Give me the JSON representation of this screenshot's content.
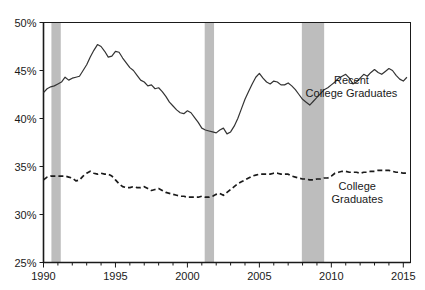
{
  "chart_data": {
    "type": "line",
    "title": "",
    "subtitle": "",
    "xlabel": "",
    "ylabel": "",
    "xlim": [
      1990,
      2015.5
    ],
    "ylim": [
      25,
      50
    ],
    "y_tick_labels": [
      "25%",
      "30%",
      "35%",
      "40%",
      "45%",
      "50%"
    ],
    "y_ticks": [
      25,
      30,
      35,
      40,
      45,
      50
    ],
    "x_tick_labels": [
      "1990",
      "1995",
      "2000",
      "2005",
      "2010",
      "2015"
    ],
    "x_ticks": [
      1990,
      1995,
      2000,
      2005,
      2010,
      2015
    ],
    "grid": false,
    "legend_position": "inline-annotation",
    "background_color": "#ffffff",
    "axis_color": "#1a1a1a",
    "recession_band_color": "#bdbdbd",
    "recession_bands": [
      {
        "start": 1990.55,
        "end": 1991.2
      },
      {
        "start": 2001.2,
        "end": 2001.85
      },
      {
        "start": 2007.95,
        "end": 2009.5
      }
    ],
    "series": [
      {
        "name": "Recent College Graduates",
        "style": "solid",
        "color": "#333333",
        "label_x": 2011.4,
        "label_y": 43.6,
        "x": [
          1990.0,
          1990.25,
          1990.5,
          1990.75,
          1991.0,
          1991.25,
          1991.5,
          1991.75,
          1992.0,
          1992.25,
          1992.5,
          1992.75,
          1993.0,
          1993.25,
          1993.5,
          1993.75,
          1994.0,
          1994.25,
          1994.5,
          1994.75,
          1995.0,
          1995.25,
          1995.5,
          1995.75,
          1996.0,
          1996.25,
          1996.5,
          1996.75,
          1997.0,
          1997.25,
          1997.5,
          1997.75,
          1998.0,
          1998.25,
          1998.5,
          1998.75,
          1999.0,
          1999.25,
          1999.5,
          1999.75,
          2000.0,
          2000.25,
          2000.5,
          2000.75,
          2001.0,
          2001.25,
          2001.5,
          2001.75,
          2002.0,
          2002.25,
          2002.5,
          2002.75,
          2003.0,
          2003.25,
          2003.5,
          2003.75,
          2004.0,
          2004.25,
          2004.5,
          2004.75,
          2005.0,
          2005.25,
          2005.5,
          2005.75,
          2006.0,
          2006.25,
          2006.5,
          2006.75,
          2007.0,
          2007.25,
          2007.5,
          2007.75,
          2008.0,
          2008.25,
          2008.5,
          2008.75,
          2009.0,
          2009.25,
          2009.5,
          2009.75,
          2010.0,
          2010.25,
          2010.5,
          2010.75,
          2011.0,
          2011.25,
          2011.5,
          2011.75,
          2012.0,
          2012.25,
          2012.5,
          2012.75,
          2013.0,
          2013.25,
          2013.5,
          2013.75,
          2014.0,
          2014.25,
          2014.5,
          2014.75,
          2015.0,
          2015.25
        ],
        "values": [
          42.7,
          43.1,
          43.3,
          43.4,
          43.6,
          43.8,
          44.3,
          44.0,
          44.2,
          44.3,
          44.4,
          45.0,
          45.6,
          46.4,
          47.1,
          47.7,
          47.5,
          47.0,
          46.4,
          46.5,
          47.0,
          46.9,
          46.3,
          45.8,
          45.3,
          45.0,
          44.5,
          44.0,
          43.8,
          43.4,
          43.5,
          43.1,
          43.2,
          42.8,
          42.3,
          41.7,
          41.3,
          40.9,
          40.6,
          40.5,
          40.8,
          40.6,
          40.1,
          39.6,
          39.0,
          38.8,
          38.7,
          38.6,
          38.5,
          38.8,
          39.0,
          38.4,
          38.6,
          39.2,
          40.0,
          41.0,
          42.0,
          42.8,
          43.6,
          44.3,
          44.7,
          44.2,
          43.8,
          43.6,
          43.9,
          43.8,
          43.5,
          43.5,
          43.7,
          43.4,
          43.0,
          42.5,
          42.0,
          41.7,
          41.4,
          41.8,
          42.2,
          42.6,
          43.0,
          43.2,
          43.5,
          43.8,
          44.2,
          44.4,
          44.6,
          44.2,
          43.6,
          43.8,
          44.2,
          44.6,
          44.4,
          44.8,
          45.1,
          44.8,
          44.6,
          44.9,
          45.2,
          45.0,
          44.5,
          44.1,
          43.9,
          44.3
        ]
      },
      {
        "name": "College Graduates",
        "style": "dashed",
        "color": "#1a1a1a",
        "label_x": 2011.8,
        "label_y": 32.6,
        "x": [
          1990.0,
          1990.25,
          1990.5,
          1990.75,
          1991.0,
          1991.25,
          1991.5,
          1991.75,
          1992.0,
          1992.25,
          1992.5,
          1992.75,
          1993.0,
          1993.25,
          1993.5,
          1993.75,
          1994.0,
          1994.25,
          1994.5,
          1994.75,
          1995.0,
          1995.25,
          1995.5,
          1995.75,
          1996.0,
          1996.25,
          1996.5,
          1996.75,
          1997.0,
          1997.25,
          1997.5,
          1997.75,
          1998.0,
          1998.25,
          1998.5,
          1998.75,
          1999.0,
          1999.25,
          1999.5,
          1999.75,
          2000.0,
          2000.25,
          2000.5,
          2000.75,
          2001.0,
          2001.25,
          2001.5,
          2001.75,
          2002.0,
          2002.25,
          2002.5,
          2002.75,
          2003.0,
          2003.25,
          2003.5,
          2003.75,
          2004.0,
          2004.25,
          2004.5,
          2004.75,
          2005.0,
          2005.25,
          2005.5,
          2005.75,
          2006.0,
          2006.25,
          2006.5,
          2006.75,
          2007.0,
          2007.25,
          2007.5,
          2007.75,
          2008.0,
          2008.25,
          2008.5,
          2008.75,
          2009.0,
          2009.25,
          2009.5,
          2009.75,
          2010.0,
          2010.25,
          2010.5,
          2010.75,
          2011.0,
          2011.25,
          2011.5,
          2011.75,
          2012.0,
          2012.25,
          2012.5,
          2012.75,
          2013.0,
          2013.25,
          2013.5,
          2013.75,
          2014.0,
          2014.25,
          2014.5,
          2014.75,
          2015.0,
          2015.25
        ],
        "values": [
          33.6,
          33.9,
          34.0,
          34.0,
          34.0,
          34.0,
          34.0,
          33.9,
          33.8,
          33.5,
          33.6,
          34.0,
          34.3,
          34.5,
          34.3,
          34.2,
          34.3,
          34.2,
          34.2,
          34.0,
          33.6,
          33.2,
          32.9,
          32.8,
          32.8,
          32.9,
          32.8,
          32.8,
          32.9,
          32.7,
          32.5,
          32.6,
          32.7,
          32.5,
          32.3,
          32.2,
          32.1,
          32.0,
          31.9,
          31.9,
          31.8,
          31.8,
          31.8,
          31.8,
          31.9,
          31.8,
          31.8,
          31.9,
          32.1,
          32.2,
          32.0,
          32.3,
          32.6,
          32.9,
          33.2,
          33.4,
          33.6,
          33.8,
          34.0,
          34.1,
          34.2,
          34.2,
          34.2,
          34.2,
          34.3,
          34.3,
          34.2,
          34.2,
          34.2,
          34.0,
          33.9,
          33.8,
          33.7,
          33.7,
          33.6,
          33.6,
          33.7,
          33.7,
          33.8,
          33.8,
          34.0,
          34.3,
          34.4,
          34.5,
          34.5,
          34.4,
          34.4,
          34.4,
          34.3,
          34.4,
          34.4,
          34.5,
          34.5,
          34.6,
          34.6,
          34.6,
          34.6,
          34.5,
          34.4,
          34.4,
          34.3,
          34.3
        ]
      }
    ],
    "annotations": [
      {
        "name": "recent-college-graduates-label",
        "lines": [
          "Recent",
          "College Graduates"
        ]
      },
      {
        "name": "college-graduates-label",
        "lines": [
          "College",
          "Graduates"
        ]
      }
    ]
  }
}
